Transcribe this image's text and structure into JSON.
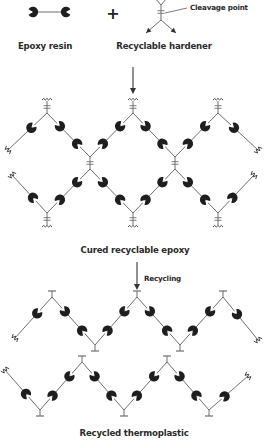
{
  "labels": {
    "epoxy_resin": "Epoxy resin",
    "recyclable_hardener": "Recyclable hardener",
    "cleavage_point": "Cleavage point",
    "plus": "+",
    "cured_recyclable_epoxy": "Cured recyclable epoxy",
    "recycling": "Recycling",
    "recycled_thermoplastic": "Recycled thermoplastic"
  },
  "colors": {
    "monomer_fill": "#1e1e1e",
    "bond_line": "#6e6e6e",
    "text": "#2b2b2b",
    "background": "#ffffff"
  },
  "legend": {
    "epoxy_resin": {
      "left": [
        33,
        12
      ],
      "right": [
        66,
        12
      ]
    },
    "hardener": {
      "center": [
        161,
        12
      ],
      "top": [
        161,
        0
      ],
      "arms": [
        [
          146,
          33
        ],
        [
          176,
          33
        ]
      ]
    }
  },
  "cured_network": {
    "top_junctions": [
      [
        47,
        113
      ],
      [
        133,
        113
      ],
      [
        218,
        113
      ]
    ],
    "middle_junctions": [
      [
        90,
        163
      ],
      [
        175,
        163
      ]
    ],
    "bottom_junctions": [
      [
        47,
        213
      ],
      [
        133,
        213
      ],
      [
        218,
        213
      ]
    ],
    "edge_ends_upper": [
      [
        8,
        150
      ],
      [
        258,
        150
      ]
    ],
    "edge_ends_lower": [
      [
        12,
        175
      ],
      [
        254,
        175
      ]
    ]
  },
  "recycled_chain_1": {
    "peaks": [
      [
        52,
        297
      ],
      [
        137,
        297
      ],
      [
        223,
        297
      ]
    ],
    "valleys": [
      [
        95,
        345
      ],
      [
        180,
        345
      ]
    ],
    "ends": [
      [
        15,
        338
      ],
      [
        258,
        340
      ]
    ]
  },
  "recycled_chain_2": {
    "peaks": [
      [
        82,
        362
      ],
      [
        167,
        362
      ]
    ],
    "valleys": [
      [
        40,
        410
      ],
      [
        124,
        410
      ],
      [
        209,
        410
      ]
    ],
    "ends": [
      [
        5,
        370
      ],
      [
        248,
        376
      ]
    ]
  }
}
